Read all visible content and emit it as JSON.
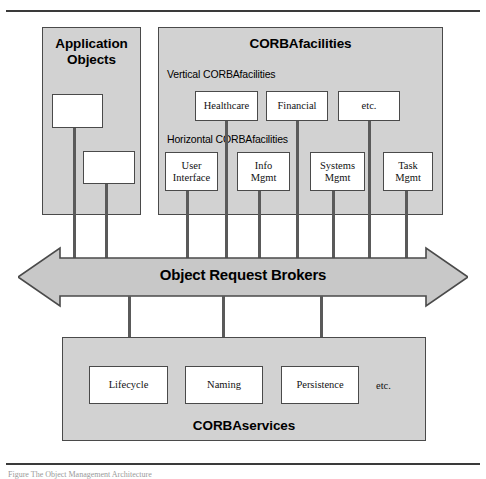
{
  "figure": {
    "caption": "Figure  The Object Management Architecture"
  },
  "application_objects": {
    "title_line1": "Application",
    "title_line2": "Objects",
    "boxes": [
      {
        "label": ""
      },
      {
        "label": ""
      }
    ]
  },
  "corbafacilities": {
    "title": "CORBAfacilities",
    "vertical_label": "Vertical CORBAfacilities",
    "horizontal_label": "Horizontal CORBAfacilities",
    "vertical_boxes": [
      {
        "label": "Healthcare"
      },
      {
        "label": "Financial"
      },
      {
        "label": "etc."
      }
    ],
    "horizontal_boxes": [
      {
        "line1": "User",
        "line2": "Interface"
      },
      {
        "line1": "Info",
        "line2": "Mgmt"
      },
      {
        "line1": "Systems",
        "line2": "Mgmt"
      },
      {
        "line1": "Task",
        "line2": "Mgmt"
      }
    ]
  },
  "orb": {
    "label": "Object Request Brokers"
  },
  "corbaservices": {
    "title": "CORBAservices",
    "boxes": [
      {
        "label": "Lifecycle"
      },
      {
        "label": "Naming"
      },
      {
        "label": "Persistence"
      }
    ],
    "etc_label": "etc."
  },
  "colors": {
    "panel_fill": "#d2d2d2",
    "box_fill": "#ffffff",
    "stroke": "#4a4a4a",
    "arrow_fill": "#c8c8c8",
    "connector": "#5a5a5a",
    "text": "#000000"
  }
}
